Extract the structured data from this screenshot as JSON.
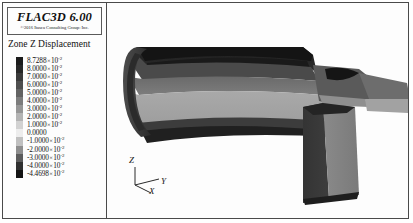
{
  "app": {
    "title": "FLAC3D 6.00",
    "copyright": "©2016  Itasca Consulting Group: Inc."
  },
  "legend": {
    "title": "Zone Z Displacement",
    "entries": [
      {
        "mantissa": "8.7288",
        "exponent": "-2",
        "color": "#1b1b1b"
      },
      {
        "mantissa": "8.0000",
        "exponent": "-2",
        "color": "#272727"
      },
      {
        "mantissa": "7.0000",
        "exponent": "-2",
        "color": "#3a3a3a"
      },
      {
        "mantissa": "6.0000",
        "exponent": "-2",
        "color": "#4e4e4e"
      },
      {
        "mantissa": "5.0000",
        "exponent": "-2",
        "color": "#626262"
      },
      {
        "mantissa": "4.0000",
        "exponent": "-2",
        "color": "#7c7c7c"
      },
      {
        "mantissa": "3.0000",
        "exponent": "-2",
        "color": "#969696"
      },
      {
        "mantissa": "2.0000",
        "exponent": "-2",
        "color": "#b4b4b4"
      },
      {
        "mantissa": "1.0000",
        "exponent": "-2",
        "color": "#d2d2d2"
      },
      {
        "mantissa": "0.0000",
        "exponent": "",
        "color": "#ededed"
      },
      {
        "mantissa": "-1.0000",
        "exponent": "-2",
        "color": "#c0c0c0"
      },
      {
        "mantissa": "-2.0000",
        "exponent": "-2",
        "color": "#8e8e8e"
      },
      {
        "mantissa": "-3.0000",
        "exponent": "-2",
        "color": "#5c5c5c"
      },
      {
        "mantissa": "-4.0000",
        "exponent": "-2",
        "color": "#303030"
      },
      {
        "mantissa": "-4.4698",
        "exponent": "-2",
        "color": "#141414"
      }
    ],
    "multiply_symbol": "×",
    "base": "10"
  },
  "viewport": {
    "axes": {
      "z": "Z",
      "y": "Y",
      "x": "X"
    }
  },
  "chart_data": {
    "type": "heatmap",
    "title": "Zone Z Displacement",
    "colorbar_label": "Zone Z Displacement",
    "tick_labels": [
      "8.7288×10⁻²",
      "8.0000×10⁻²",
      "7.0000×10⁻²",
      "6.0000×10⁻²",
      "5.0000×10⁻²",
      "4.0000×10⁻²",
      "3.0000×10⁻²",
      "2.0000×10⁻²",
      "1.0000×10⁻²",
      "0.0000",
      "-1.0000×10⁻²",
      "-2.0000×10⁻²",
      "-3.0000×10⁻²",
      "-4.0000×10⁻²",
      "-4.4698×10⁻²"
    ],
    "values": [
      0.087288,
      0.08,
      0.07,
      0.06,
      0.05,
      0.04,
      0.03,
      0.02,
      0.01,
      0.0,
      -0.01,
      -0.02,
      -0.03,
      -0.04,
      -0.044698
    ],
    "vmin": -0.044698,
    "vmax": 0.087288,
    "colormap": "grayscale",
    "legend_position": "left",
    "grid": false,
    "axis_triad": [
      "Z",
      "Y",
      "X"
    ]
  }
}
